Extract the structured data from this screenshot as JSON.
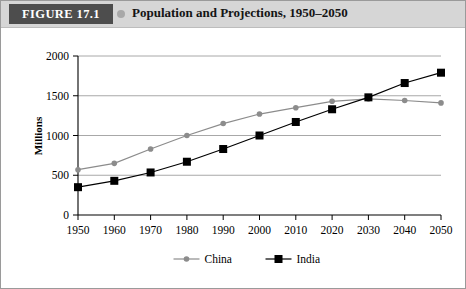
{
  "header": {
    "badge": "FIGURE 17.1",
    "dot_icon": "bullet-dot-icon",
    "title": "Population and Projections, 1950–2050",
    "band_color": "#d6d6d6",
    "badge_color": "#4d4d4d"
  },
  "chart_data": {
    "type": "line",
    "title": "Population and Projections, 1950–2050",
    "xlabel": "",
    "ylabel": "Millions",
    "x": [
      1950,
      1960,
      1970,
      1980,
      1990,
      2000,
      2010,
      2020,
      2030,
      2040,
      2050
    ],
    "xticklabels": [
      "1950",
      "1960",
      "1970",
      "1980",
      "1990",
      "2000",
      "2010",
      "2020",
      "2030",
      "2040",
      "2050"
    ],
    "yticklabels": [
      "0",
      "500",
      "1000",
      "1500",
      "2000"
    ],
    "yticks": [
      0,
      500,
      1000,
      1500,
      2000
    ],
    "ylim": [
      0,
      2000
    ],
    "xlim": [
      1950,
      2050
    ],
    "grid": "horizontal",
    "legend_position": "bottom",
    "series": [
      {
        "name": "China",
        "color": "#8c8c8c",
        "marker": "circle",
        "values": [
          570,
          650,
          830,
          1000,
          1150,
          1270,
          1350,
          1430,
          1460,
          1440,
          1410
        ]
      },
      {
        "name": "India",
        "color": "#000000",
        "marker": "square",
        "values": [
          350,
          430,
          535,
          670,
          830,
          1000,
          1170,
          1330,
          1480,
          1660,
          1790
        ]
      }
    ]
  }
}
